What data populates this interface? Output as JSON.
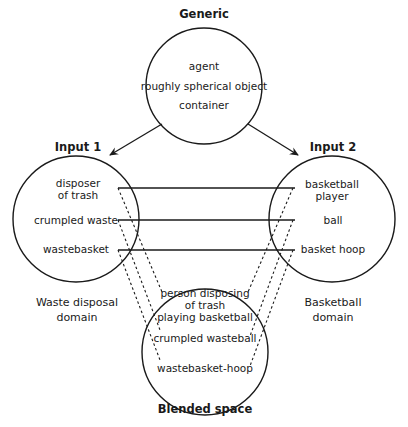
{
  "generic": {
    "title": "Generic",
    "items": [
      "agent",
      "roughly spherical object",
      "container"
    ]
  },
  "input1": {
    "title": "Input 1",
    "items": [
      "disposer of trash",
      "crumpled waste",
      "wastebasket"
    ],
    "item0_line1": "disposer",
    "item0_line2": "of trash",
    "domain_line1": "Waste disposal",
    "domain_line2": "domain"
  },
  "input2": {
    "title": "Input 2",
    "items": [
      "basketball player",
      "ball",
      "basket hoop"
    ],
    "item0_line1": "basketball",
    "item0_line2": "player",
    "domain_line1": "Basketball",
    "domain_line2": "domain"
  },
  "blended": {
    "title": "Blended space",
    "items": [
      "person disposing of trash playing basketball",
      "crumpled wasteball",
      "wastebasket-hoop"
    ],
    "item0_line1": "person disposing",
    "item0_line2": "of trash",
    "item0_line3": "playing basketball"
  },
  "colors": {
    "stroke": "#1a1a1a",
    "background": "#ffffff"
  }
}
